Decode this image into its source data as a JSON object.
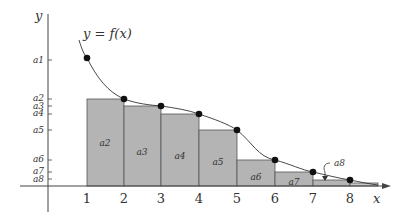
{
  "diagram": {
    "curve_label": "y = f(x)",
    "x_axis_label": "x",
    "y_axis_label": "y",
    "x_ticks": [
      "1",
      "2",
      "3",
      "4",
      "5",
      "6",
      "7",
      "8"
    ],
    "y_ticks": [
      "a1",
      "a2",
      "a3",
      "a4",
      "a5",
      "a6",
      "a7",
      "a8"
    ],
    "rect_labels": [
      "a2",
      "a3",
      "a4",
      "a5",
      "a6",
      "a7"
    ],
    "callout_label": "a8",
    "colors": {
      "rect_fill": "#b4b4b4",
      "rect_stroke": "#555555",
      "axis": "#444444",
      "curve": "#333333",
      "point": "#111111"
    }
  }
}
